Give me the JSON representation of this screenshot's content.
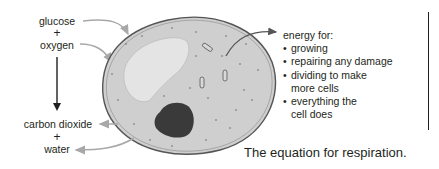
{
  "reactants": {
    "glucose": "glucose",
    "plus1": "+",
    "oxygen": "oxygen"
  },
  "products": {
    "carbon_dioxide": "carbon dioxide",
    "plus2": "+",
    "water": "water"
  },
  "energy": {
    "heading": "energy for:",
    "items": [
      "growing",
      "repairing any damage",
      "dividing to make more cells",
      "everything the cell does"
    ]
  },
  "caption": "The equation for respiration.",
  "colors": {
    "cytoplasm": "#cfcfcf",
    "vacuole": "#e4e4e4",
    "nucleus": "#3a3a3a",
    "membrane": "#555555",
    "arrow_gray": "#a8a8a8",
    "text": "#231f20"
  }
}
